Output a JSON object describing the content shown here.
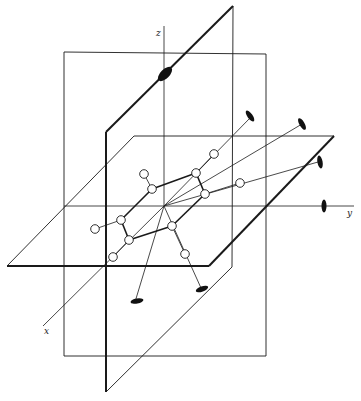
{
  "diagram": {
    "type": "3d-symmetry-elements",
    "colors": {
      "line": "#1a1a1a",
      "atom_fill": "#ffffff",
      "axis_symbol": "#111111",
      "background": "#ffffff"
    },
    "axes": [
      {
        "id": "x",
        "label": "x",
        "from": [
          164,
          206
        ],
        "to": [
          43,
          326
        ],
        "label_pos": [
          44,
          334
        ]
      },
      {
        "id": "y",
        "label": "y",
        "from": [
          64,
          206
        ],
        "to": [
          354,
          206
        ],
        "label_pos": [
          347,
          216
        ]
      },
      {
        "id": "z",
        "label": "z",
        "from": [
          164,
          206
        ],
        "to": [
          164,
          26
        ],
        "label_pos": [
          156,
          36
        ]
      }
    ],
    "planes": [
      {
        "id": "vertical-rect-plane",
        "points": [
          [
            64,
            52
          ],
          [
            266,
            54
          ],
          [
            266,
            356
          ],
          [
            64,
            356
          ]
        ],
        "thick": false
      },
      {
        "id": "diagonal-dihedral-plane",
        "points": [
          [
            106,
            132
          ],
          [
            233,
            6
          ],
          [
            232,
            267
          ],
          [
            106,
            392
          ]
        ],
        "thick_edges": [
          [
            0,
            3
          ],
          [
            0,
            1
          ]
        ]
      },
      {
        "id": "horizontal-plane",
        "points": [
          [
            7,
            266
          ],
          [
            209,
            266
          ],
          [
            334,
            136
          ],
          [
            134,
            136
          ]
        ],
        "thick_edges": [
          [
            0,
            1
          ],
          [
            1,
            2
          ]
        ]
      }
    ],
    "ring_atoms": [
      {
        "id": "C1",
        "pos": [
          152,
          189
        ]
      },
      {
        "id": "C2",
        "pos": [
          196,
          173
        ]
      },
      {
        "id": "C3",
        "pos": [
          205,
          194
        ]
      },
      {
        "id": "C4",
        "pos": [
          172,
          226
        ]
      },
      {
        "id": "C5",
        "pos": [
          129,
          240
        ]
      },
      {
        "id": "C6",
        "pos": [
          121,
          220
        ]
      }
    ],
    "substituent_atoms": [
      {
        "id": "H1",
        "pos": [
          144,
          174
        ],
        "bonded_to": "C1"
      },
      {
        "id": "H2",
        "pos": [
          214,
          154
        ],
        "bonded_to": "C2"
      },
      {
        "id": "H3",
        "pos": [
          240,
          183
        ],
        "bonded_to": "C3"
      },
      {
        "id": "H4",
        "pos": [
          185,
          254
        ],
        "bonded_to": "C4"
      },
      {
        "id": "H5",
        "pos": [
          113,
          257
        ],
        "bonded_to": "C5"
      },
      {
        "id": "H6",
        "pos": [
          95,
          229
        ],
        "bonded_to": "C6"
      }
    ],
    "rotation_axes": [
      {
        "id": "C2-z-axis-diag",
        "from": [
          164,
          206
        ],
        "end": [
          250,
          118
        ],
        "symbol_pos": [
          250,
          116
        ],
        "symbol_angle": 55
      },
      {
        "id": "C2-a",
        "from": [
          164,
          206
        ],
        "end": [
          302,
          124
        ],
        "symbol_pos": [
          302,
          124
        ],
        "symbol_angle": 60
      },
      {
        "id": "C2-b",
        "from": [
          164,
          206
        ],
        "end": [
          318,
          162
        ],
        "symbol_pos": [
          320,
          162
        ],
        "symbol_angle": 80
      },
      {
        "id": "C2-c",
        "from": [
          164,
          206
        ],
        "end": [
          135,
          302
        ],
        "symbol_pos": [
          137,
          301
        ],
        "symbol_angle": -10
      },
      {
        "id": "C2-d",
        "from": [
          164,
          206
        ],
        "end": [
          201,
          288
        ],
        "symbol_pos": [
          202,
          289
        ],
        "symbol_angle": -20
      }
    ],
    "axis_symbols": [
      {
        "id": "main-axis-symbol",
        "pos": [
          165,
          74
        ],
        "rx": 9,
        "ry": 4.5,
        "angle": -45
      },
      {
        "id": "y-axis-symbol",
        "pos": [
          324,
          206
        ],
        "rx": 2.5,
        "ry": 6.5,
        "angle": 0
      }
    ]
  }
}
